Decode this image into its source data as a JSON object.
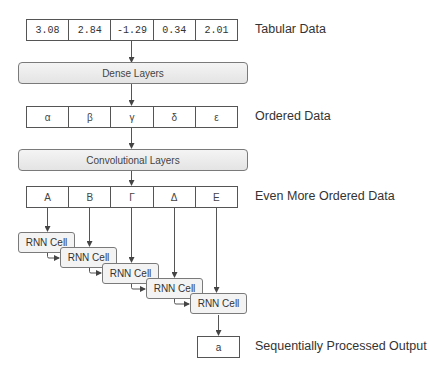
{
  "diagram": {
    "tabular": {
      "values": [
        "3.08",
        "2.84",
        "-1.29",
        "0.34",
        "2.01"
      ],
      "label": "Tabular Data"
    },
    "dense": {
      "label": "Dense Layers"
    },
    "ordered": {
      "values": [
        "α",
        "β",
        "γ",
        "δ",
        "ε"
      ],
      "label": "Ordered Data"
    },
    "conv": {
      "label": "Convolutional Layers"
    },
    "more_ordered": {
      "values": [
        "Α",
        "Β",
        "Γ",
        "Δ",
        "Ε"
      ],
      "label": "Even More Ordered Data"
    },
    "rnn_cells": [
      {
        "label": "RNN Cell"
      },
      {
        "label": "RNN Cell"
      },
      {
        "label": "RNN Cell"
      },
      {
        "label": "RNN Cell"
      },
      {
        "label": "RNN Cell"
      }
    ],
    "output": {
      "value": "a",
      "label": "Sequentially Processed Output"
    },
    "colors": {
      "line": "#444444",
      "layer_fill": "#eeeeee",
      "cell_border": "#555555"
    }
  }
}
